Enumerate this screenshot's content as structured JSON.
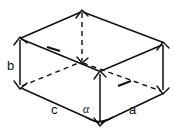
{
  "figure": {
    "kind": "cuboid-dimension-diagram",
    "stroke_color": "#101010",
    "background_color": "#ffffff",
    "labels": {
      "height": "b",
      "depth": "c",
      "width": "a",
      "angle": "α"
    },
    "vertices": {
      "top_back": {
        "x": 82,
        "y": 11
      },
      "top_left": {
        "x": 20,
        "y": 38
      },
      "top_right": {
        "x": 163,
        "y": 43
      },
      "top_front": {
        "x": 100,
        "y": 72
      },
      "bottom_back": {
        "x": 82,
        "y": 62
      },
      "bottom_left": {
        "x": 20,
        "y": 87
      },
      "bottom_right": {
        "x": 163,
        "y": 92
      },
      "bottom_front": {
        "x": 100,
        "y": 124
      }
    },
    "edges": [
      {
        "name": "top-left-to-top-back",
        "style": "solid"
      },
      {
        "name": "top-back-to-top-right",
        "style": "solid"
      },
      {
        "name": "top-left-to-top-front",
        "style": "solid"
      },
      {
        "name": "top-front-to-top-right",
        "style": "solid"
      },
      {
        "name": "left-vertical-height",
        "style": "dimension"
      },
      {
        "name": "right-vertical-height",
        "style": "dimension"
      },
      {
        "name": "front-vertical-height",
        "style": "dimension"
      },
      {
        "name": "top-back-to-bottom-back",
        "style": "hidden"
      },
      {
        "name": "bottom-left-to-bottom-back",
        "style": "hidden"
      },
      {
        "name": "bottom-back-to-bottom-right",
        "style": "hidden"
      },
      {
        "name": "bottom-left-to-bottom-front",
        "style": "solid"
      },
      {
        "name": "bottom-front-to-bottom-right",
        "style": "solid"
      }
    ],
    "angle_marker": {
      "at_vertex": "bottom_front",
      "label": "α"
    }
  }
}
